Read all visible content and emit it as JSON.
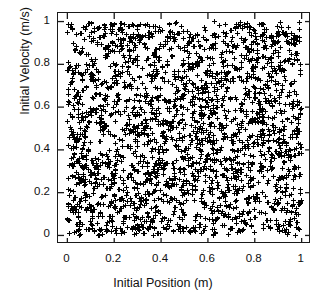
{
  "chart_data": {
    "type": "scatter",
    "title": "",
    "subtitle": "",
    "xlabel": "Initial Position (m)",
    "ylabel": "Initial Velocity (m/s)",
    "xlim": [
      -0.04,
      1.04
    ],
    "ylim": [
      -0.04,
      1.04
    ],
    "xticks": [
      0,
      0.2,
      0.4,
      0.6,
      0.8,
      1
    ],
    "yticks": [
      0,
      0.2,
      0.4,
      0.6,
      0.8,
      1
    ],
    "xtick_labels": [
      "0",
      "0.2",
      "0.4",
      "0.6",
      "0.8",
      "1"
    ],
    "ytick_labels": [
      "0",
      "0.2",
      "0.4",
      "0.6",
      "0.8",
      "1"
    ],
    "grid": false,
    "legend": null,
    "legend_position": "none",
    "frame": "box",
    "tick_direction": "in",
    "marker": "plus",
    "marker_color": "#000000",
    "marker_size_px": 5,
    "marker_linewidth": 1.1,
    "point_count": 2200,
    "distribution": "uniform",
    "x_range": [
      0.0,
      1.0
    ],
    "y_range": [
      0.0,
      1.0
    ],
    "annotations": [],
    "series": [
      {
        "name": "initial conditions",
        "marker": "plus",
        "color": "#000000",
        "n": 2200,
        "x_min": 0.0,
        "x_max": 1.0,
        "y_min": 0.0,
        "y_max": 1.0
      }
    ]
  },
  "axes": {
    "x_title": "Initial Position (m)",
    "y_title": "Initial Velocity (m/s)",
    "x_tick_labels": [
      "0",
      "0.2",
      "0.4",
      "0.6",
      "0.8",
      "1"
    ],
    "y_tick_labels": [
      "0",
      "0.2",
      "0.4",
      "0.6",
      "0.8",
      "1"
    ]
  },
  "colors": {
    "background": "#ffffff",
    "axis": "#1a1a1a",
    "text": "#111111",
    "marker": "#000000"
  }
}
